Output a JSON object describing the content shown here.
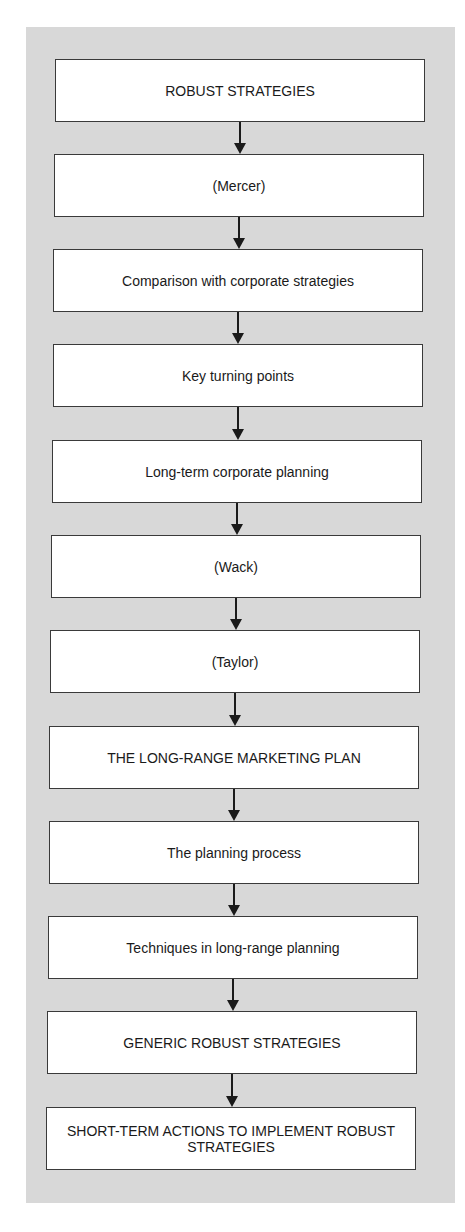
{
  "diagram": {
    "type": "vertical-flowchart",
    "background_color": "#d8d8d8",
    "box_color": "#ffffff",
    "nodes": [
      {
        "id": 1,
        "label": "ROBUST STRATEGIES"
      },
      {
        "id": 2,
        "label": "(Mercer)"
      },
      {
        "id": 3,
        "label": "Comparison with corporate strategies"
      },
      {
        "id": 4,
        "label": "Key turning points"
      },
      {
        "id": 5,
        "label": "Long-term corporate planning"
      },
      {
        "id": 6,
        "label": "(Wack)"
      },
      {
        "id": 7,
        "label": "(Taylor)"
      },
      {
        "id": 8,
        "label": "THE LONG-RANGE MARKETING PLAN"
      },
      {
        "id": 9,
        "label": "The planning process"
      },
      {
        "id": 10,
        "label": "Techniques in long-range planning"
      },
      {
        "id": 11,
        "label": "GENERIC ROBUST STRATEGIES"
      },
      {
        "id": 12,
        "label": "SHORT-TERM ACTIONS TO IMPLEMENT ROBUST STRATEGIES"
      }
    ],
    "edges": [
      {
        "from": 1,
        "to": 2
      },
      {
        "from": 2,
        "to": 3
      },
      {
        "from": 3,
        "to": 4
      },
      {
        "from": 4,
        "to": 5
      },
      {
        "from": 5,
        "to": 6
      },
      {
        "from": 6,
        "to": 7
      },
      {
        "from": 7,
        "to": 8
      },
      {
        "from": 8,
        "to": 9
      },
      {
        "from": 9,
        "to": 10
      },
      {
        "from": 10,
        "to": 11
      },
      {
        "from": 11,
        "to": 12
      }
    ]
  }
}
